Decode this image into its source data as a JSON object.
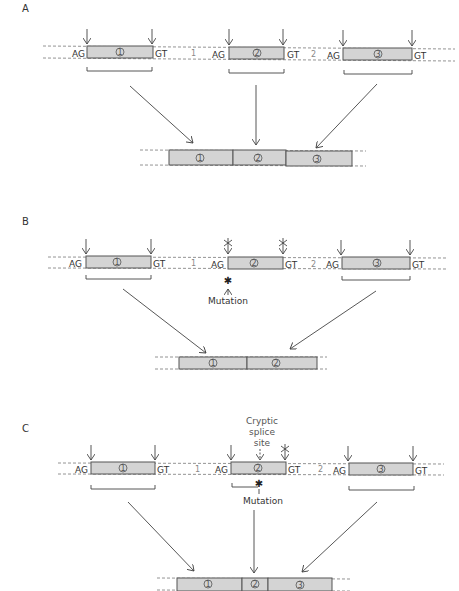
{
  "panels": [
    {
      "id": "A",
      "label": "A",
      "pre_mrna": {
        "exons": [
          {
            "number": "1",
            "acceptor": "AG",
            "donor": "GT"
          },
          {
            "number": "2",
            "acceptor": "AG",
            "donor": "GT"
          },
          {
            "number": "3",
            "acceptor": "AG",
            "donor": "GT"
          }
        ],
        "introns": [
          "1",
          "2"
        ]
      },
      "spliced_product": [
        "1",
        "2",
        "3"
      ]
    },
    {
      "id": "B",
      "label": "B",
      "pre_mrna": {
        "exons": [
          {
            "number": "1",
            "acceptor": "AG",
            "donor": "GT"
          },
          {
            "number": "2",
            "acceptor": "AG",
            "donor": "GT",
            "sites_blocked": true
          },
          {
            "number": "3",
            "acceptor": "AG",
            "donor": "GT"
          }
        ],
        "introns": [
          "1",
          "2"
        ]
      },
      "annotation": "Mutation",
      "spliced_product": [
        "1",
        "2"
      ]
    },
    {
      "id": "C",
      "label": "C",
      "pre_mrna": {
        "exons": [
          {
            "number": "1",
            "acceptor": "AG",
            "donor": "GT"
          },
          {
            "number": "2",
            "acceptor": "AG",
            "donor": "GT",
            "donor_blocked": true
          },
          {
            "number": "3",
            "acceptor": "AG",
            "donor": "GT"
          }
        ],
        "introns": [
          "1",
          "2"
        ]
      },
      "annotation": "Mutation",
      "cryptic_label": [
        "Cryptic",
        "splice",
        "site"
      ],
      "spliced_product": [
        "1",
        "2",
        "3"
      ]
    }
  ]
}
